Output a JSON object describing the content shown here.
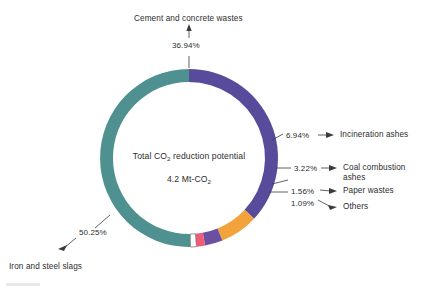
{
  "chart_data": {
    "type": "pie",
    "variant": "donut",
    "title": "",
    "center_label_line1": "Total CO2 reduction potential",
    "center_label_line2": "4.2 Mt-CO2",
    "center_value": "4.2",
    "center_unit": "Mt-CO2",
    "total_percent": "100.00%",
    "categories": [
      "Cement and concrete wastes",
      "Incineration ashes",
      "Coal combustion ashes",
      "Paper wastes",
      "Others",
      "Iron and steel slags"
    ],
    "values": [
      36.94,
      6.94,
      3.22,
      1.56,
      1.09,
      50.25
    ],
    "value_labels": [
      "36.94%",
      "6.94%",
      "3.22%",
      "1.56%",
      "1.09%",
      "50.25%"
    ],
    "colors": [
      "#584B9B",
      "#F2A33C",
      "#6B4FA0",
      "#EE5C78",
      "#FFFFFF",
      "#4E9190"
    ],
    "legend": "none",
    "grid": false,
    "slices": [
      {
        "name": "cement-and-concrete-wastes",
        "label": "Cement and concrete wastes",
        "percent_label": "36.94%",
        "value": 36.94,
        "color": "#584B9B"
      },
      {
        "name": "incineration-ashes",
        "label": "Incineration ashes",
        "percent_label": "6.94%",
        "value": 6.94,
        "color": "#F2A33C"
      },
      {
        "name": "coal-combustion-ashes",
        "label_line1": "Coal combustion",
        "label_line2": "ashes",
        "label": "Coal combustion ashes",
        "percent_label": "3.22%",
        "value": 3.22,
        "color": "#6B4FA0"
      },
      {
        "name": "paper-wastes",
        "label": "Paper wastes",
        "percent_label": "1.56%",
        "value": 1.56,
        "color": "#EE5C78"
      },
      {
        "name": "others",
        "label": "Others",
        "percent_label": "1.09%",
        "value": 1.09,
        "color": "#FFFFFF"
      },
      {
        "name": "iron-and-steel-slags",
        "label": "Iron and steel slags",
        "percent_label": "50.25%",
        "value": 50.25,
        "color": "#4E9190"
      }
    ]
  }
}
